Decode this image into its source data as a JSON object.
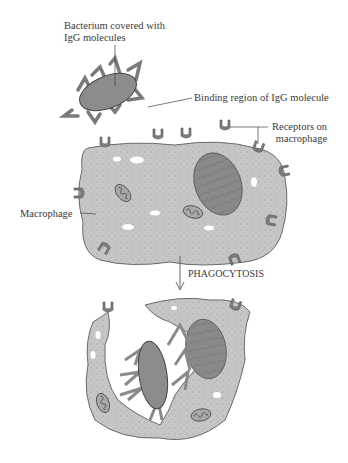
{
  "labels": {
    "bacterium_line1": "Bacterium covered with",
    "bacterium_line2": "IgG molecules",
    "binding_region": "Binding region of IgG molecule",
    "receptors_line1": "Receptors on",
    "receptors_line2": "macrophage",
    "macrophage": "Macrophage",
    "process": "PHAGOCYTOSIS"
  },
  "colors": {
    "cell_fill": "#c4c4c4",
    "cell_stroke": "#6a6a6a",
    "nucleus_fill": "#8a8a8a",
    "bacterium_fill": "#8c8c8c",
    "receptor_fill": "#7e7e7e",
    "igg_fill": "#a6a6a6",
    "text": "#3a3a3a"
  }
}
